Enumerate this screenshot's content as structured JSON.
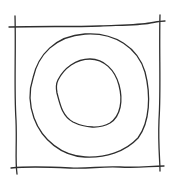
{
  "sketch": {
    "description": "Hand-drawn square frame containing two concentric irregular circles",
    "stroke_color": "#2e2e2e",
    "background_color": "#ffffff",
    "stroke_width": 1.3,
    "shapes": [
      {
        "name": "frame-top-line",
        "kind": "line"
      },
      {
        "name": "frame-bottom-line",
        "kind": "line"
      },
      {
        "name": "frame-left-line",
        "kind": "line"
      },
      {
        "name": "frame-right-line",
        "kind": "line"
      },
      {
        "name": "outer-circle",
        "kind": "closed-curve"
      },
      {
        "name": "inner-circle",
        "kind": "closed-curve"
      }
    ]
  }
}
